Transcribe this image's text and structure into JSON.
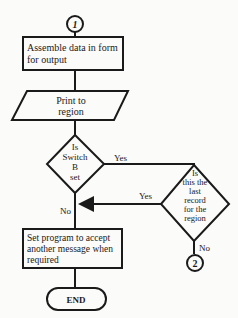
{
  "connectors": {
    "start": "1",
    "exit": "2"
  },
  "nodes": {
    "assemble": [
      "Assemble data in form",
      "for output"
    ],
    "print": [
      "Print to",
      "region"
    ],
    "switch_b": [
      "Is",
      "Switch",
      "B",
      "set"
    ],
    "last_record": [
      "Is",
      "this the",
      "last",
      "record",
      "for the",
      "region"
    ],
    "set_program": [
      "Set program to accept",
      "another message when",
      "required"
    ],
    "end": "END"
  },
  "edge_labels": {
    "switch_yes": "Yes",
    "switch_no": "No",
    "last_yes": "Yes",
    "last_no": "No"
  }
}
